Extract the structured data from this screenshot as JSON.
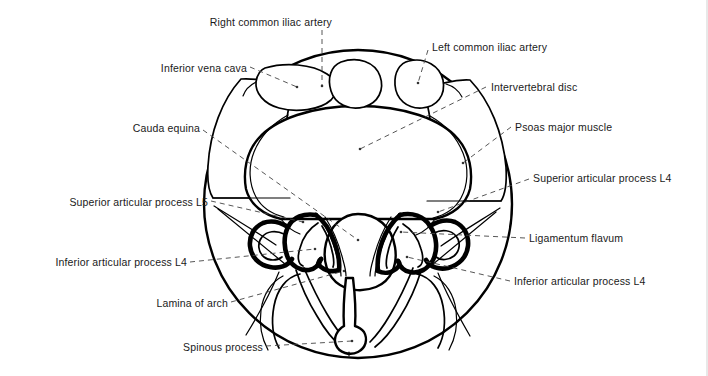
{
  "figure": {
    "background_color": "#ffffff",
    "stroke_color": "#000000",
    "leader_line_color": "#555555",
    "view": "transverse section through intervertebral disc"
  },
  "labels": [
    {
      "id": "right-common-iliac-artery",
      "text": "Right common iliac artery",
      "align": "center",
      "x": 256,
      "y": 16,
      "leader": "vertical-dashed-down"
    },
    {
      "id": "left-common-iliac-artery",
      "text": "Left common iliac artery",
      "align": "left",
      "x": 432,
      "y": 41,
      "leader": "dashed-down-left"
    },
    {
      "id": "inferior-vena-cava",
      "text": "Inferior vena cava",
      "align": "right",
      "x": 163,
      "y": 62,
      "leader": "dashed-down-right"
    },
    {
      "id": "intervertebral-disc",
      "text": "Intervertebral disc",
      "align": "left",
      "x": 491,
      "y": 81,
      "leader": "dashed-down-left"
    },
    {
      "id": "cauda-equina",
      "text": "Cauda equina",
      "align": "right",
      "x": 126,
      "y": 122,
      "leader": "dashed-down-right"
    },
    {
      "id": "psoas-major-muscle",
      "text": "Psoas major muscle",
      "align": "left",
      "x": 515,
      "y": 121,
      "leader": "dashed-down-left"
    },
    {
      "id": "superior-articular-process-l4",
      "text": "Superior articular process L4",
      "align": "left",
      "x": 533,
      "y": 172,
      "leader": "dashed-left"
    },
    {
      "id": "superior-articular-process-l5",
      "text": "Superior articular process L5",
      "align": "right",
      "x": 37,
      "y": 196,
      "leader": "dashed-right"
    },
    {
      "id": "ligamentum-flavum",
      "text": "Ligamentum flavum",
      "align": "left",
      "x": 529,
      "y": 232,
      "leader": "dashed-left"
    },
    {
      "id": "inferior-articular-process-l4-left",
      "text": "Inferior articular process L4",
      "align": "right",
      "x": 51,
      "y": 256,
      "leader": "dashed-right"
    },
    {
      "id": "inferior-articular-process-l4-right",
      "text": "Inferior articular process L4",
      "align": "left",
      "x": 514,
      "y": 275,
      "leader": "dashed-left"
    },
    {
      "id": "lamina-of-arch",
      "text": "Lamina of arch",
      "align": "right",
      "x": 138,
      "y": 297,
      "leader": "dashed-right"
    },
    {
      "id": "spinous-process",
      "text": "Spinous process",
      "align": "right",
      "x": 178,
      "y": 341,
      "leader": "dashed-right"
    }
  ],
  "structures": [
    {
      "id": "body-outline",
      "name": "trunk outline circle"
    },
    {
      "id": "vertebral-body",
      "name": "vertebral body / intervertebral disc"
    },
    {
      "id": "ivc-vessel",
      "name": "inferior vena cava lumen"
    },
    {
      "id": "right-iliac-vessel",
      "name": "right common iliac artery lumen"
    },
    {
      "id": "left-iliac-vessel",
      "name": "left common iliac artery lumen"
    },
    {
      "id": "psoas-left",
      "name": "psoas major muscle left"
    },
    {
      "id": "psoas-right",
      "name": "psoas major muscle right"
    },
    {
      "id": "dural-sac",
      "name": "dural sac containing cauda equina"
    },
    {
      "id": "ligamentum-flavum-left",
      "name": "ligamentum flavum left"
    },
    {
      "id": "ligamentum-flavum-right",
      "name": "ligamentum flavum right"
    },
    {
      "id": "facet-joint-left",
      "name": "facet joint left"
    },
    {
      "id": "facet-joint-right",
      "name": "facet joint right"
    },
    {
      "id": "lamina-left",
      "name": "lamina left"
    },
    {
      "id": "lamina-right",
      "name": "lamina right"
    },
    {
      "id": "spinous-process-shape",
      "name": "spinous process"
    },
    {
      "id": "erector-spinae-left",
      "name": "erector spinae muscle left"
    },
    {
      "id": "erector-spinae-right",
      "name": "erector spinae muscle right"
    }
  ]
}
